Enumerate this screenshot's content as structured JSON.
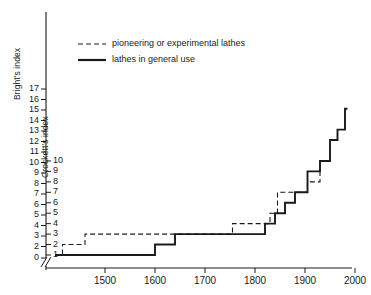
{
  "chart_data": {
    "type": "line",
    "title": "",
    "subtitle": "",
    "xlabel": "",
    "ylabel_left": "Bright's index",
    "ylabel_right": "Crockett's index",
    "xlim": [
      1400,
      2010
    ],
    "x_ticks": [
      1500,
      1600,
      1700,
      1800,
      1900,
      2000
    ],
    "x_tick_labels": [
      "1500",
      "1600",
      "1700",
      "1800",
      "1900",
      "2000"
    ],
    "y_left_ticks": [
      0,
      2,
      3,
      4,
      5,
      6,
      7,
      8,
      9,
      10,
      11,
      12,
      13,
      14,
      15,
      16,
      17
    ],
    "y_left_tick_labels": [
      "0",
      "2",
      "3",
      "4",
      "5",
      "6",
      "7",
      "8",
      "9",
      "10",
      "11",
      "12",
      "13",
      "14",
      "15",
      "16",
      "17"
    ],
    "y_right_ticks": [
      1,
      2,
      3,
      4,
      5,
      6,
      7,
      8,
      9,
      10
    ],
    "y_right_tick_labels": [
      "1",
      "2",
      "3",
      "4",
      "5",
      "6",
      "7",
      "8",
      "9",
      "10"
    ],
    "axis_break": true,
    "axis_break_symbol": "//",
    "grid": false,
    "legend_position": "top-center",
    "series": [
      {
        "name": "pioneering or experimental lathes",
        "style": "dashed",
        "color": "#1a1a1a",
        "step": "post",
        "points": [
          {
            "x": 1400,
            "y": 1
          },
          {
            "x": 1415,
            "y": 2
          },
          {
            "x": 1460,
            "y": 3
          },
          {
            "x": 1690,
            "y": 3
          },
          {
            "x": 1755,
            "y": 4
          },
          {
            "x": 1830,
            "y": 5
          },
          {
            "x": 1845,
            "y": 7
          },
          {
            "x": 1905,
            "y": 8
          },
          {
            "x": 1930,
            "y": 9
          }
        ]
      },
      {
        "name": "lathes in general use",
        "style": "solid",
        "color": "#1a1a1a",
        "step": "post",
        "points": [
          {
            "x": 1400,
            "y": 1
          },
          {
            "x": 1600,
            "y": 2
          },
          {
            "x": 1640,
            "y": 3
          },
          {
            "x": 1820,
            "y": 4
          },
          {
            "x": 1840,
            "y": 5
          },
          {
            "x": 1860,
            "y": 6
          },
          {
            "x": 1880,
            "y": 7
          },
          {
            "x": 1905,
            "y": 9
          },
          {
            "x": 1930,
            "y": 10
          },
          {
            "x": 1950,
            "y": 12
          },
          {
            "x": 1965,
            "y": 13
          },
          {
            "x": 1980,
            "y": 15
          },
          {
            "x": 1985,
            "y": 15
          }
        ]
      }
    ]
  },
  "legend": {
    "items": [
      {
        "label": "pioneering or experimental lathes",
        "style": "dashed"
      },
      {
        "label": "lathes in general use",
        "style": "solid"
      }
    ]
  }
}
